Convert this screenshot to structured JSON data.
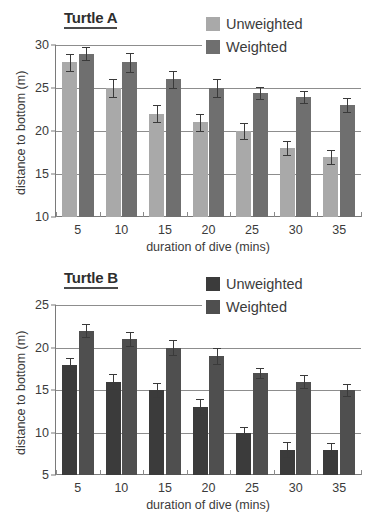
{
  "figure": {
    "background": "#ffffff"
  },
  "panels": [
    {
      "id": "a",
      "title": "Turtle A",
      "legend": [
        {
          "label": "Unweighted",
          "color": "#a9a9a9"
        },
        {
          "label": "Weighted",
          "color": "#6f6f6f"
        }
      ],
      "chart_data": {
        "type": "bar",
        "title": "Turtle A",
        "xlabel": "duration of dive (mins)",
        "ylabel": "distance to bottom (m)",
        "categories": [
          "5",
          "10",
          "15",
          "20",
          "25",
          "30",
          "35"
        ],
        "ylim": [
          10,
          30
        ],
        "yticks": [
          10,
          15,
          20,
          25,
          30
        ],
        "grid": true,
        "legend_position": "top-right",
        "series": [
          {
            "name": "Unweighted",
            "color": "#a9a9a9",
            "values": [
              28,
              25,
              22,
              21,
              20,
              18,
              17
            ],
            "errors": [
              1,
              1,
              1,
              1,
              0.9,
              0.8,
              0.8
            ]
          },
          {
            "name": "Weighted",
            "color": "#6f6f6f",
            "values": [
              29,
              28,
              26,
              25,
              24.4,
              24,
              23
            ],
            "errors": [
              0.8,
              1.1,
              1,
              1.1,
              0.7,
              0.7,
              0.8
            ]
          }
        ]
      }
    },
    {
      "id": "b",
      "title": "Turtle B",
      "legend": [
        {
          "label": "Unweighted",
          "color": "#3b3b3b"
        },
        {
          "label": "Weighted",
          "color": "#4f4f4f"
        }
      ],
      "chart_data": {
        "type": "bar",
        "title": "Turtle B",
        "xlabel": "duration of dive (mins)",
        "ylabel": "distance to bottom (m)",
        "categories": [
          "5",
          "10",
          "15",
          "20",
          "25",
          "30",
          "35"
        ],
        "ylim": [
          5,
          25
        ],
        "yticks": [
          5,
          10,
          15,
          20,
          25
        ],
        "grid": true,
        "legend_position": "top-right",
        "series": [
          {
            "name": "Unweighted",
            "color": "#3b3b3b",
            "values": [
              18,
              16,
              15,
              13,
              10,
              8,
              8
            ],
            "errors": [
              0.8,
              0.9,
              0.8,
              0.9,
              0.7,
              0.9,
              0.8
            ]
          },
          {
            "name": "Weighted",
            "color": "#4f4f4f",
            "values": [
              22,
              21,
              20,
              19,
              17,
              16,
              15
            ],
            "errors": [
              0.8,
              0.8,
              0.9,
              0.9,
              0.6,
              0.8,
              0.7
            ]
          }
        ]
      }
    }
  ]
}
